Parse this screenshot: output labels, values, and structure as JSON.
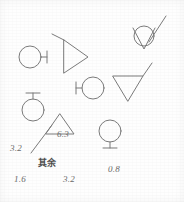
{
  "page": {
    "background_color": "#fefefe",
    "ink_color": "#777777",
    "label_color": "#6a6a6a",
    "width": 184,
    "height": 202
  },
  "symbols": [
    {
      "id": "circle-stem-right-top-left",
      "name": "circle-with-right-stem-symbol",
      "shape": "circle with horizontal stem to the right ending in vertical bar",
      "cx": 30,
      "cy": 57,
      "r": 11
    },
    {
      "id": "triangle-right-with-leader",
      "name": "right-pointing-triangle-symbol",
      "shape": "right-pointing triangle with diagonal leader line from apex",
      "cx": 74,
      "cy": 57
    },
    {
      "id": "circle-in-vee-with-leader",
      "name": "circle-in-vee-symbol",
      "shape": "circle enclosed in downward vee with diagonal leader line",
      "cx": 145,
      "cy": 37
    },
    {
      "id": "circle-stem-left",
      "name": "circle-with-left-stem-symbol",
      "shape": "circle with horizontal stem to the left ending in vertical bar",
      "cx": 93,
      "cy": 88,
      "r": 11
    },
    {
      "id": "triangle-down-with-leader",
      "name": "down-pointing-triangle-symbol",
      "shape": "downward-pointing triangle with diagonal leader line",
      "cx": 128,
      "cy": 90
    },
    {
      "id": "circle-stem-up",
      "name": "circle-with-top-stem-symbol",
      "shape": "circle with vertical stem above ending in horizontal bar",
      "cx": 33,
      "cy": 110,
      "r": 11
    },
    {
      "id": "triangle-up-with-leader",
      "name": "up-pointing-triangle-symbol",
      "shape": "upward-pointing triangle with diagonal leader line",
      "cx": 61,
      "cy": 130
    },
    {
      "id": "circle-stem-down",
      "name": "circle-with-bottom-stem-symbol",
      "shape": "circle with vertical stem below ending in horizontal bar",
      "cx": 110,
      "cy": 133,
      "r": 11
    }
  ],
  "labels": [
    {
      "id": "value-6-3",
      "name": "roughness-value-6-3",
      "text": "6.3",
      "x": 57,
      "y": 136
    },
    {
      "id": "value-3-2-left",
      "name": "roughness-value-3-2-left",
      "text": "3.2",
      "x": 10,
      "y": 149
    },
    {
      "id": "remainder-note",
      "name": "remainder-note-label",
      "text": "其余",
      "x": 38,
      "y": 164
    },
    {
      "id": "value-0-8",
      "name": "roughness-value-0-8",
      "text": "0.8",
      "x": 108,
      "y": 170
    },
    {
      "id": "value-1-6",
      "name": "roughness-value-1-6",
      "text": "1.6",
      "x": 14,
      "y": 180
    },
    {
      "id": "value-3-2-bottom",
      "name": "roughness-value-3-2-bottom",
      "text": "3.2",
      "x": 63,
      "y": 180
    }
  ]
}
